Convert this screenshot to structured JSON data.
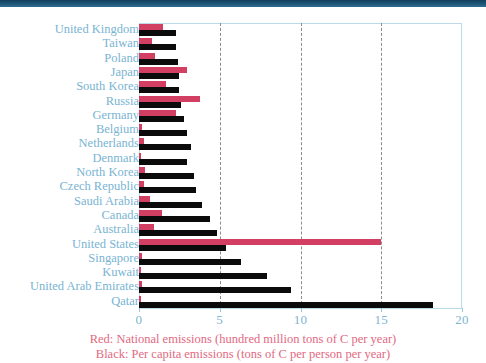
{
  "chart_data": {
    "type": "bar",
    "orientation": "horizontal",
    "title": "",
    "xlabel": "",
    "ylabel": "",
    "xlim": [
      0,
      20
    ],
    "xticks": [
      0,
      5,
      10,
      15,
      20
    ],
    "xtick_labels": [
      "0",
      "5",
      "10",
      "15",
      "20"
    ],
    "gridlines_at": [
      5,
      10,
      15
    ],
    "grid": true,
    "legend_position": "bottom",
    "categories": [
      "United Kingdom",
      "Taiwan",
      "Poland",
      "Japan",
      "South Korea",
      "Russia",
      "Germany",
      "Belgium",
      "Netherlands",
      "Denmark",
      "North Korea",
      "Czech Republic",
      "Saudi Arabia",
      "Canada",
      "Australia",
      "United States",
      "Singapore",
      "Kuwait",
      "United Arab Emirates",
      "Qatar"
    ],
    "series": [
      {
        "name": "Red: National emissions (hundred million tons of C per year)",
        "color": "#d33f63",
        "values": [
          1.5,
          0.8,
          1.0,
          3.0,
          1.7,
          3.8,
          2.3,
          0.2,
          0.3,
          0.1,
          0.35,
          0.3,
          0.7,
          1.4,
          0.9,
          15.0,
          0.2,
          0.15,
          0.2,
          0.1
        ]
      },
      {
        "name": "Black: Per capita emissions (tons of C per person per year)",
        "color": "#0b0b0b",
        "values": [
          2.3,
          2.3,
          2.4,
          2.5,
          2.5,
          2.6,
          2.8,
          3.0,
          3.2,
          3.0,
          3.4,
          3.5,
          3.9,
          4.4,
          4.8,
          5.4,
          6.3,
          7.9,
          9.4,
          18.2
        ]
      }
    ]
  },
  "legend": {
    "line_red": "Red: National emissions (hundred million tons of C per year)",
    "line_black": "Black: Per capita emissions (tons of C per person per year)"
  },
  "colors": {
    "red": "#d33f63",
    "black": "#0b0b0b",
    "label_blue": "#79b4d3",
    "legend_pink": "#e2697f",
    "header_navy": "#1d5677",
    "frame_blue": "#bcdbe9",
    "gridline_gray": "#8b8b8b"
  }
}
